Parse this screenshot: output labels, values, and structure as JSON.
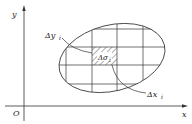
{
  "diagram": {
    "axes": {
      "x_label": "x",
      "y_label": "y",
      "origin_label": "O"
    },
    "region": {
      "shape": "ellipse",
      "grid": "rectangular partition"
    },
    "labels": {
      "delta_y": {
        "main": "Δy",
        "sub": "i"
      },
      "delta_sigma": {
        "main": "Δσ",
        "sub": "i"
      },
      "delta_x": {
        "main": "Δx",
        "sub": "i"
      }
    },
    "colors": {
      "stroke": "#333333",
      "background": "#ffffff"
    }
  }
}
